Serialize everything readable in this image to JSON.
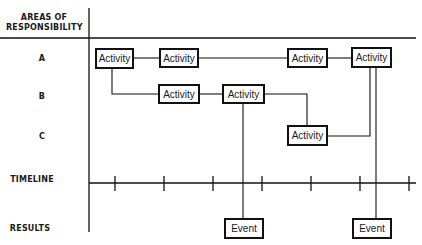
{
  "diagram": {
    "header": {
      "areas_label": "AREAS OF RESPONSIBILITY"
    },
    "rows": [
      {
        "key": "A",
        "label": "A"
      },
      {
        "key": "B",
        "label": "B"
      },
      {
        "key": "C",
        "label": "C"
      },
      {
        "key": "timeline",
        "label": "TIMELINE"
      },
      {
        "key": "results",
        "label": "RESULTS"
      }
    ],
    "activities": [
      {
        "id": "A1",
        "row": "A",
        "label": "Activity"
      },
      {
        "id": "A2",
        "row": "A",
        "label": "Activity"
      },
      {
        "id": "A3",
        "row": "A",
        "label": "Activity"
      },
      {
        "id": "A4",
        "row": "A",
        "label": "Activity"
      },
      {
        "id": "B1",
        "row": "B",
        "label": "Activity"
      },
      {
        "id": "B2",
        "row": "B",
        "label": "Activity"
      },
      {
        "id": "C1",
        "row": "C",
        "label": "Activity"
      }
    ],
    "events": [
      {
        "id": "E1",
        "label": "Event",
        "from": "B2"
      },
      {
        "id": "E2",
        "label": "Event",
        "from": "A4"
      }
    ],
    "timeline": {
      "tick_count": 7
    },
    "connections": [
      [
        "A1",
        "A2"
      ],
      [
        "A2",
        "A3"
      ],
      [
        "A3",
        "A4"
      ],
      [
        "A1",
        "B1"
      ],
      [
        "B1",
        "B2"
      ],
      [
        "B2",
        "C1"
      ],
      [
        "C1",
        "A4"
      ],
      [
        "B2",
        "E1"
      ],
      [
        "A4",
        "E2"
      ]
    ]
  }
}
